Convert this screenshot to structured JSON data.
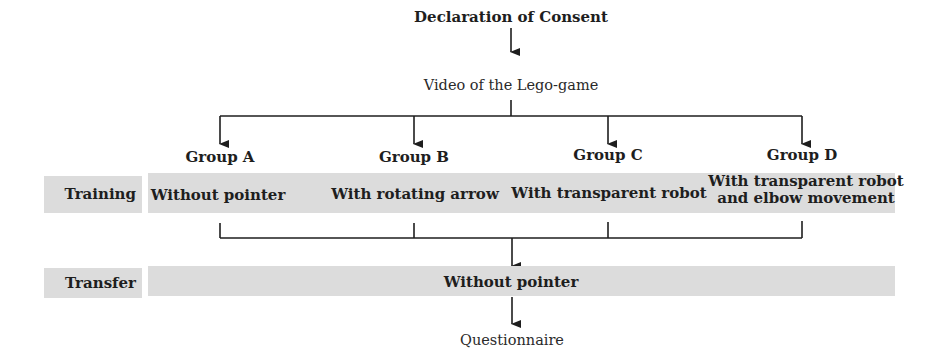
{
  "diagram": {
    "type": "flowchart",
    "nodes": {
      "consent": "Declaration of Consent",
      "video": "Video of the Lego-game",
      "questionnaire": "Questionnaire"
    },
    "phases": {
      "training": "Training",
      "transfer": "Transfer"
    },
    "groups": [
      {
        "name": "Group A",
        "training_condition": "Without pointer"
      },
      {
        "name": "Group B",
        "training_condition": "With rotating arrow"
      },
      {
        "name": "Group C",
        "training_condition": "With transparent robot"
      },
      {
        "name": "Group D",
        "training_condition_line1": "With transparent robot",
        "training_condition_line2": "and elbow movement"
      }
    ],
    "transfer_condition": "Without pointer",
    "colors": {
      "bar_fill": "#dcdcdc",
      "line": "#1e1e1e",
      "text": "#1e1e1e"
    }
  }
}
